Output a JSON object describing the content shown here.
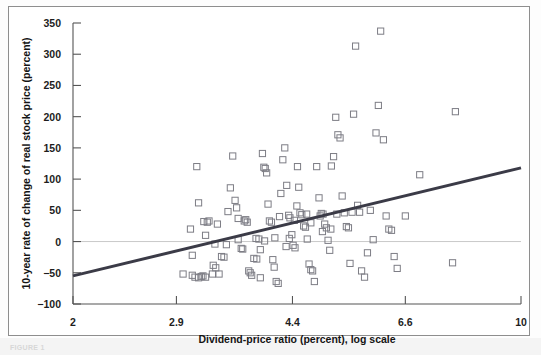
{
  "figure": {
    "caption_fragment": "FIGURE 1",
    "frame_visible": true
  },
  "chart_data": {
    "type": "scatter",
    "title": "",
    "xlabel": "Dividend-price ratio (percent), log scale",
    "ylabel": "10-year rate of change of real stock price (percent)",
    "x_scale": "log",
    "xlim": [
      2,
      10
    ],
    "ylim": [
      -100,
      350
    ],
    "x_ticks": [
      2,
      2.9,
      4.4,
      6.6,
      10
    ],
    "x_tick_labels": [
      "2",
      "2.9",
      "4.4",
      "6.6",
      "10"
    ],
    "y_ticks": [
      -100,
      -50,
      0,
      50,
      100,
      150,
      200,
      250,
      300,
      350
    ],
    "y_tick_labels": [
      "−100",
      "−50",
      "0",
      "50",
      "100",
      "150",
      "200",
      "250",
      "300",
      "350"
    ],
    "grid": false,
    "legend": null,
    "marker": "open-square",
    "marker_color": "#7d7d85",
    "reference_lines": [
      {
        "name": "zero-line",
        "type": "horizontal",
        "y": 0,
        "color": "#c9c9c9"
      }
    ],
    "series": [
      {
        "name": "10-year real stock price change vs dividend-price ratio",
        "points": [
          [
            2.97,
            -52
          ],
          [
            3.07,
            -54
          ],
          [
            3.1,
            -57
          ],
          [
            3.14,
            -58
          ],
          [
            3.17,
            -56
          ],
          [
            3.19,
            -55
          ],
          [
            3.22,
            -57
          ],
          [
            3.07,
            -22
          ],
          [
            3.05,
            20
          ],
          [
            3.12,
            120
          ],
          [
            3.14,
            62
          ],
          [
            3.2,
            32
          ],
          [
            3.24,
            31
          ],
          [
            3.26,
            33
          ],
          [
            3.22,
            10
          ],
          [
            3.33,
            -4
          ],
          [
            3.31,
            -38
          ],
          [
            3.34,
            -42
          ],
          [
            3.3,
            -52
          ],
          [
            3.38,
            -52
          ],
          [
            3.36,
            28
          ],
          [
            3.41,
            -24
          ],
          [
            3.44,
            -25
          ],
          [
            3.49,
            48
          ],
          [
            3.52,
            86
          ],
          [
            3.55,
            137
          ],
          [
            3.58,
            66
          ],
          [
            3.6,
            54
          ],
          [
            3.62,
            3
          ],
          [
            3.66,
            -11
          ],
          [
            3.68,
            -12
          ],
          [
            3.7,
            33
          ],
          [
            3.72,
            35
          ],
          [
            3.74,
            31
          ],
          [
            3.76,
            -47
          ],
          [
            3.78,
            -50
          ],
          [
            3.8,
            -54
          ],
          [
            3.83,
            -27
          ],
          [
            3.86,
            5
          ],
          [
            3.9,
            4
          ],
          [
            3.92,
            -13
          ],
          [
            3.95,
            141
          ],
          [
            3.97,
            119
          ],
          [
            3.99,
            117
          ],
          [
            4.01,
            110
          ],
          [
            4.03,
            60
          ],
          [
            4.05,
            33
          ],
          [
            4.08,
            31
          ],
          [
            4.1,
            -29
          ],
          [
            4.12,
            -41
          ],
          [
            4.15,
            -64
          ],
          [
            4.18,
            -67
          ],
          [
            4.22,
            77
          ],
          [
            4.25,
            131
          ],
          [
            4.28,
            150
          ],
          [
            4.31,
            90
          ],
          [
            4.34,
            42
          ],
          [
            4.36,
            38
          ],
          [
            4.39,
            11
          ],
          [
            4.41,
            -6
          ],
          [
            4.44,
            -10
          ],
          [
            4.47,
            57
          ],
          [
            4.5,
            87
          ],
          [
            4.52,
            46
          ],
          [
            4.55,
            43
          ],
          [
            4.58,
            25
          ],
          [
            4.61,
            23
          ],
          [
            4.64,
            4
          ],
          [
            4.67,
            -36
          ],
          [
            4.7,
            -45
          ],
          [
            4.73,
            -47
          ],
          [
            4.76,
            -64
          ],
          [
            4.8,
            120
          ],
          [
            4.84,
            70
          ],
          [
            4.88,
            45
          ],
          [
            4.91,
            44
          ],
          [
            4.94,
            28
          ],
          [
            4.97,
            22
          ],
          [
            5.0,
            2
          ],
          [
            5.03,
            -14
          ],
          [
            5.06,
            121
          ],
          [
            5.1,
            136
          ],
          [
            5.14,
            199
          ],
          [
            5.18,
            171
          ],
          [
            5.22,
            166
          ],
          [
            5.26,
            73
          ],
          [
            5.3,
            46
          ],
          [
            5.34,
            24
          ],
          [
            5.38,
            22
          ],
          [
            5.41,
            -35
          ],
          [
            5.48,
            204
          ],
          [
            5.52,
            313
          ],
          [
            5.56,
            58
          ],
          [
            5.6,
            47
          ],
          [
            5.64,
            -47
          ],
          [
            5.7,
            -57
          ],
          [
            5.76,
            -18
          ],
          [
            5.82,
            50
          ],
          [
            5.88,
            3
          ],
          [
            5.94,
            174
          ],
          [
            5.99,
            218
          ],
          [
            6.04,
            337
          ],
          [
            6.1,
            163
          ],
          [
            6.16,
            41
          ],
          [
            6.22,
            20
          ],
          [
            6.28,
            18
          ],
          [
            6.34,
            -24
          ],
          [
            6.41,
            -43
          ],
          [
            6.6,
            41
          ],
          [
            6.95,
            107
          ],
          [
            7.9,
            208
          ],
          [
            7.82,
            -34
          ],
          [
            3.98,
            1
          ],
          [
            4.2,
            40
          ],
          [
            4.63,
            44
          ],
          [
            4.86,
            41
          ],
          [
            5.45,
            47
          ],
          [
            3.47,
            -5
          ],
          [
            3.87,
            -28
          ],
          [
            4.43,
            34
          ],
          [
            4.7,
            30
          ],
          [
            5.05,
            20
          ],
          [
            3.62,
            37
          ],
          [
            4.35,
            5
          ],
          [
            4.9,
            16
          ],
          [
            4.3,
            -8
          ],
          [
            5.16,
            44
          ],
          [
            4.13,
            6
          ],
          [
            3.92,
            -58
          ],
          [
            4.48,
            120
          ]
        ]
      }
    ],
    "trendline": {
      "name": "regression-line",
      "color": "#3b3b47",
      "from": [
        2,
        -55
      ],
      "to": [
        10,
        118
      ]
    }
  }
}
